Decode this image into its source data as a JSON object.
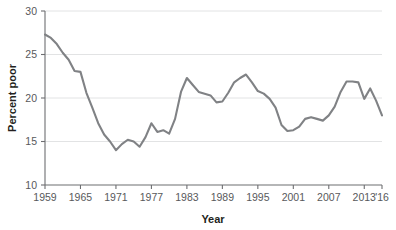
{
  "chart_data": {
    "type": "line",
    "title": "",
    "xlabel": "Year",
    "ylabel": "Percent poor",
    "xlim": [
      1959,
      2016
    ],
    "ylim": [
      10,
      30
    ],
    "grid": "horizontal",
    "legend": "none",
    "line_color": "#808285",
    "grid_color": "#e2e3e4",
    "axis_color": "#6d6e71",
    "text_color": "#58595b",
    "title_color": "#231f20",
    "y_ticks": [
      10,
      15,
      20,
      25,
      30
    ],
    "y_tick_labels": [
      "10",
      "15",
      "20",
      "25",
      "30"
    ],
    "x_ticks": [
      1959,
      1965,
      1971,
      1977,
      1983,
      1989,
      1995,
      2001,
      2007,
      2013,
      2016
    ],
    "x_tick_labels": [
      "1959",
      "1965",
      "1971",
      "1977",
      "1983",
      "1989",
      "1995",
      "2001",
      "2007",
      "2013",
      "'16"
    ],
    "x": [
      1959,
      1960,
      1961,
      1962,
      1963,
      1964,
      1965,
      1966,
      1967,
      1968,
      1969,
      1970,
      1971,
      1972,
      1973,
      1974,
      1975,
      1976,
      1977,
      1978,
      1979,
      1980,
      1981,
      1982,
      1983,
      1984,
      1985,
      1986,
      1987,
      1988,
      1989,
      1990,
      1991,
      1992,
      1993,
      1994,
      1995,
      1996,
      1997,
      1998,
      1999,
      2000,
      2001,
      2002,
      2003,
      2004,
      2005,
      2006,
      2007,
      2008,
      2009,
      2010,
      2011,
      2012,
      2013,
      2014,
      2015,
      2016
    ],
    "values": [
      27.3,
      26.9,
      26.2,
      25.2,
      24.4,
      23.1,
      23.0,
      20.6,
      18.9,
      17.1,
      15.8,
      15.0,
      14.0,
      14.7,
      15.2,
      15.0,
      14.4,
      15.5,
      17.1,
      16.1,
      16.3,
      15.9,
      17.6,
      20.7,
      22.3,
      21.5,
      20.7,
      20.5,
      20.3,
      19.5,
      19.6,
      20.6,
      21.8,
      22.3,
      22.7,
      21.8,
      20.8,
      20.5,
      19.9,
      18.9,
      16.9,
      16.2,
      16.3,
      16.7,
      17.6,
      17.8,
      17.6,
      17.4,
      18.0,
      19.0,
      20.7,
      21.9,
      21.9,
      21.8,
      19.9,
      21.1,
      19.7,
      18.0
    ],
    "series_name": "Percent poor"
  }
}
